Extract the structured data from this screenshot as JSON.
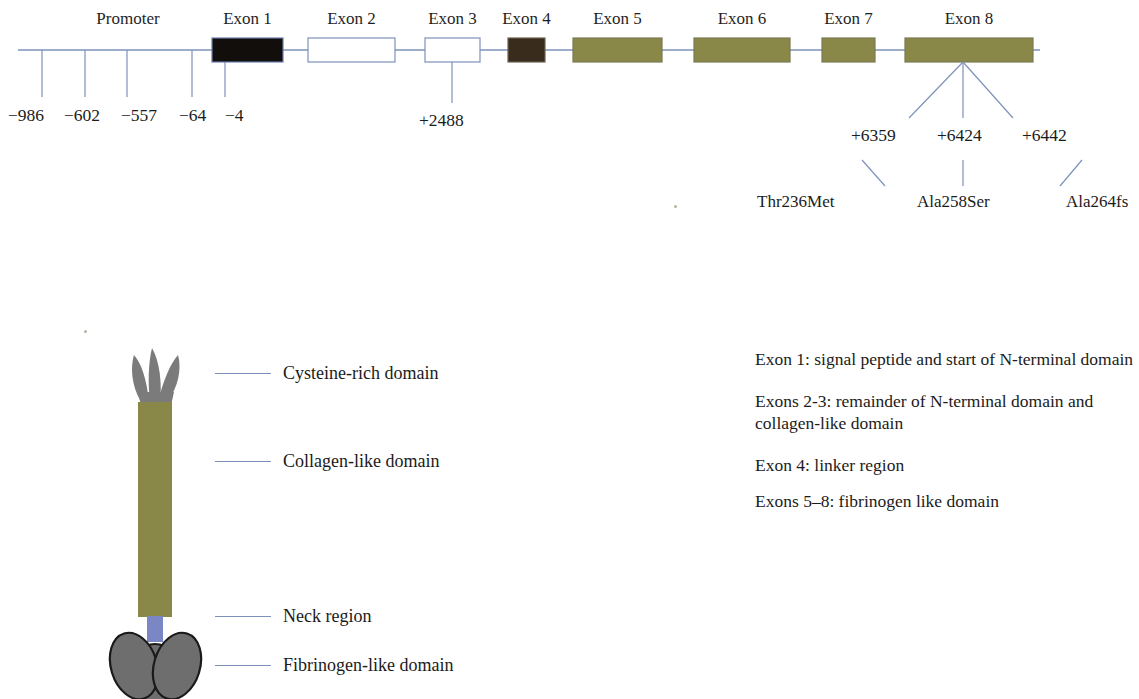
{
  "gene_map": {
    "promoter_label": "Promoter",
    "exons": [
      {
        "label": "Exon 1",
        "x": 212,
        "width": 71,
        "fill": "#110e0c",
        "stroke": "#6b7fa8",
        "style": "filled-black"
      },
      {
        "label": "Exon 2",
        "x": 308,
        "width": 87,
        "fill": "#ffffff",
        "stroke": "#7d92bb",
        "style": "open"
      },
      {
        "label": "Exon 3",
        "x": 425,
        "width": 55,
        "fill": "#ffffff",
        "stroke": "#7d92bb",
        "style": "open"
      },
      {
        "label": "Exon 4",
        "x": 508,
        "width": 37,
        "fill": "#3a2c1d",
        "stroke": "#6b6352",
        "style": "filled-brown"
      },
      {
        "label": "Exon 5",
        "x": 573,
        "width": 89,
        "fill": "#8a8848",
        "stroke": "#7a7a52",
        "style": "filled-olive"
      },
      {
        "label": "Exon 6",
        "x": 694,
        "width": 96,
        "fill": "#8a8848",
        "stroke": "#7a7a52",
        "style": "filled-olive"
      },
      {
        "label": "Exon 7",
        "x": 822,
        "width": 53,
        "fill": "#8a8848",
        "stroke": "#7a7a52",
        "style": "filled-olive"
      },
      {
        "label": "Exon 8",
        "x": 905,
        "width": 128,
        "fill": "#8a8848",
        "stroke": "#7a7a52",
        "style": "filled-olive"
      }
    ],
    "promoter_positions": [
      {
        "label": "−986",
        "tick_x": 42,
        "text_x": 8
      },
      {
        "label": "−602",
        "tick_x": 85,
        "text_x": 64
      },
      {
        "label": "−557",
        "tick_x": 127,
        "text_x": 121
      },
      {
        "label": "−64",
        "tick_x": 192,
        "text_x": 179
      },
      {
        "label": "−4",
        "tick_x": 225,
        "text_x": 225
      }
    ],
    "intron_positions": [
      {
        "label": "+2488",
        "tick_x": 452,
        "text_x": 419
      }
    ],
    "exon8_positions": [
      {
        "label": "+6359",
        "x": 851,
        "fan_x": 909
      },
      {
        "label": "+6424",
        "x": 937,
        "fan_x": 963
      },
      {
        "label": "+6442",
        "x": 1022,
        "fan_x": 1013
      }
    ],
    "mutations": [
      {
        "label": "Thr236Met",
        "x": 757
      },
      {
        "label": "Ala258Ser",
        "x": 917
      },
      {
        "label": "Ala264fs",
        "x": 1066
      }
    ],
    "baseline_y": 50,
    "colors": {
      "line": "#7d92bb",
      "olive": "#8a8848",
      "black_exon": "#110e0c",
      "brown_exon": "#3a2c1d"
    }
  },
  "protein": {
    "colors": {
      "cysteine_rich": "#7b7b7b",
      "collagen": "#8a8848",
      "neck": "#7b86c4",
      "fibrinogen": "#6e6e6e",
      "outline": "#1a1a1a"
    },
    "legend": [
      {
        "label": "Cysteine-rich domain",
        "line_y": 373,
        "text_y": 363,
        "line_x": 215,
        "line_w": 56,
        "text_x": 283
      },
      {
        "label": "Collagen-like domain",
        "line_y": 461,
        "text_y": 451,
        "line_x": 215,
        "line_w": 56,
        "text_x": 283
      },
      {
        "label": "Neck region",
        "line_y": 616,
        "text_y": 606,
        "line_x": 215,
        "line_w": 56,
        "text_x": 283
      },
      {
        "label": "Fibrinogen-like domain",
        "line_y": 665,
        "text_y": 655,
        "line_x": 215,
        "line_w": 56,
        "text_x": 283
      }
    ]
  },
  "notes": [
    "Exon 1: signal peptide and start of N-terminal domain",
    "Exons 2-3: remainder of N-terminal domain and collagen-like domain",
    "Exon 4: linker region",
    "Exons 5–8: fibrinogen like domain"
  ]
}
